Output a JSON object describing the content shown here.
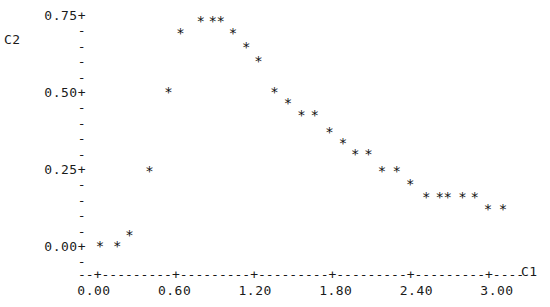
{
  "plot": {
    "type": "character-scatter",
    "y_axis_name": "C2",
    "x_axis_name": "C1",
    "marker": "*"
  },
  "y_axis": {
    "major_ticks": [
      {
        "label": "0.75+",
        "value": 0.75
      },
      {
        "label": "0.50+",
        "value": 0.5
      },
      {
        "label": "0.25+",
        "value": 0.25
      },
      {
        "label": "0.00+",
        "value": 0.0
      }
    ],
    "minor_mark": "-",
    "minor_count_between": 4,
    "minor_below_zero": 1
  },
  "x_axis": {
    "rule": "--+---------+---------+---------+---------+---------+----",
    "tick_labels": [
      "0.00",
      "0.60",
      "1.20",
      "1.80",
      "2.40",
      "3.00"
    ],
    "tick_values": [
      0.0,
      0.6,
      1.2,
      1.8,
      2.4,
      3.0
    ]
  },
  "chart_data": {
    "type": "scatter",
    "title": "",
    "xlabel": "C1",
    "ylabel": "C2",
    "xlim": [
      -0.12,
      3.22
    ],
    "ylim": [
      -0.055,
      0.79
    ],
    "grid": false,
    "legend": null,
    "marker": "*",
    "series": [
      {
        "name": "C2 vs C1",
        "points": [
          [
            0.04,
            0.0
          ],
          [
            0.17,
            0.0
          ],
          [
            0.26,
            0.035
          ],
          [
            0.41,
            0.245
          ],
          [
            0.55,
            0.5
          ],
          [
            0.64,
            0.69
          ],
          [
            0.79,
            0.73
          ],
          [
            0.88,
            0.73
          ],
          [
            0.94,
            0.73
          ],
          [
            1.03,
            0.69
          ],
          [
            1.13,
            0.645
          ],
          [
            1.22,
            0.6
          ],
          [
            1.34,
            0.5
          ],
          [
            1.44,
            0.465
          ],
          [
            1.54,
            0.425
          ],
          [
            1.64,
            0.425
          ],
          [
            1.75,
            0.37
          ],
          [
            1.85,
            0.335
          ],
          [
            1.94,
            0.3
          ],
          [
            2.04,
            0.3
          ],
          [
            2.14,
            0.245
          ],
          [
            2.25,
            0.245
          ],
          [
            2.35,
            0.2
          ],
          [
            2.47,
            0.16
          ],
          [
            2.57,
            0.16
          ],
          [
            2.63,
            0.16
          ],
          [
            2.74,
            0.16
          ],
          [
            2.83,
            0.16
          ],
          [
            2.93,
            0.12
          ],
          [
            3.04,
            0.12
          ]
        ]
      }
    ]
  }
}
